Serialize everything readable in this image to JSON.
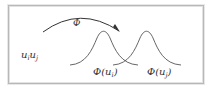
{
  "diagram": {
    "input_label": {
      "base": "u",
      "sub_i": "i",
      "sub_j": "j"
    },
    "mapping_label": "Φ",
    "output_labels": [
      {
        "prefix": "Φ(u",
        "sub": "i",
        "suffix": ")"
      },
      {
        "prefix": "Φ(u",
        "sub": "j",
        "suffix": ")"
      }
    ],
    "colors": {
      "line": "#333333",
      "frame": "#b8b8b8",
      "background": "#ffffff"
    }
  }
}
